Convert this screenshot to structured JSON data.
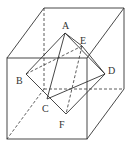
{
  "diagram": {
    "labels": {
      "A": "A",
      "B": "B",
      "C": "C",
      "D": "D",
      "E": "E",
      "F": "F"
    },
    "colors": {
      "line": "#333333",
      "background": "#ffffff"
    }
  }
}
